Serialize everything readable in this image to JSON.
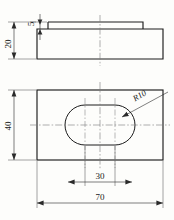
{
  "drawing": {
    "title": "Stepped block with obround slot - two view orthographic drawing",
    "views": [
      {
        "name": "front-view",
        "description": "Stepped rectangular block, elevation"
      },
      {
        "name": "plan-view",
        "description": "Rectangular plate with central obround slot"
      }
    ],
    "dimensions": [
      {
        "id": "height_overall",
        "label": "20",
        "view": "front-view",
        "orientation": "vertical",
        "meaning": "overall block height"
      },
      {
        "id": "step_height",
        "label": "5",
        "view": "front-view",
        "orientation": "vertical",
        "meaning": "raised step height"
      },
      {
        "id": "plate_depth",
        "label": "40",
        "view": "plan-view",
        "orientation": "vertical",
        "meaning": "plate depth"
      },
      {
        "id": "slot_centers",
        "label": "30",
        "view": "plan-view",
        "orientation": "horizontal",
        "meaning": "slot centre-to-centre distance"
      },
      {
        "id": "plate_width",
        "label": "70",
        "view": "plan-view",
        "orientation": "horizontal",
        "meaning": "overall plate width"
      },
      {
        "id": "slot_radius",
        "label": "R10",
        "view": "plan-view",
        "orientation": "leader",
        "meaning": "slot end radius"
      }
    ],
    "colors": {
      "object_line": "#1c1c1c",
      "dimension_line": "#2a2a2a",
      "center_line": "#7a7a7a",
      "paper": "#fdfdfb"
    }
  }
}
